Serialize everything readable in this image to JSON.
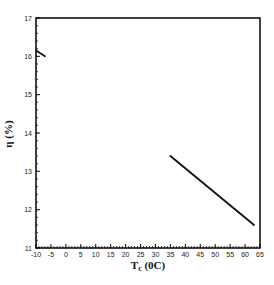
{
  "chart_data": {
    "type": "line",
    "title": "",
    "xlabel": "T",
    "xlabel_subscript": "c",
    "xlabel_unit": " (°C)",
    "xlabel_unit_display": " (0C)",
    "ylabel": "η (%)",
    "xlim": [
      -10,
      65
    ],
    "ylim": [
      11,
      17
    ],
    "x_ticks": [
      -10,
      -5,
      0,
      5,
      10,
      15,
      20,
      25,
      30,
      35,
      40,
      45,
      50,
      55,
      60,
      65
    ],
    "y_ticks": [
      11,
      12,
      13,
      14,
      15,
      16,
      17
    ],
    "x_minor_step": 1,
    "y_minor_step": 0.2,
    "grid": false,
    "legend": null,
    "series": [
      {
        "name": "segment-low-temperature",
        "x": [
          -10,
          -7
        ],
        "y": [
          16.15,
          16.0
        ]
      },
      {
        "name": "segment-high-temperature",
        "x": [
          35,
          63
        ],
        "y": [
          13.4,
          11.6
        ]
      }
    ],
    "line_color": "#111111"
  }
}
